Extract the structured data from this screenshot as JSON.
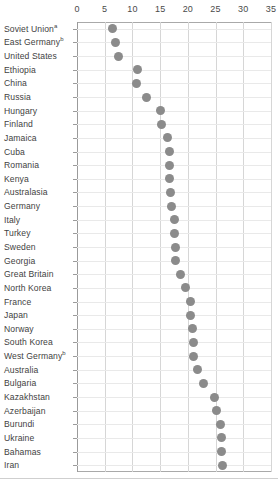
{
  "chart_data": {
    "type": "scatter",
    "title": "",
    "subtitle": "",
    "xlabel": "",
    "ylabel": "",
    "xlim": [
      0,
      35
    ],
    "ylim": null,
    "grid": true,
    "legend": null,
    "orientation": "horizontal",
    "xticks": [
      0,
      5,
      10,
      15,
      20,
      25,
      30,
      35
    ],
    "xtick_labels": [
      "0",
      "5",
      "10",
      "15",
      "20",
      "25",
      "30",
      "35"
    ],
    "marker": {
      "shape": "circle",
      "color": "#8b8b8b",
      "size": 9
    },
    "categories": [
      "Soviet Union",
      "East Germany",
      "United States",
      "Ethiopia",
      "China",
      "Russia",
      "Hungary",
      "Finland",
      "Jamaica",
      "Cuba",
      "Romania",
      "Kenya",
      "Australasia",
      "Germany",
      "Italy",
      "Turkey",
      "Sweden",
      "Georgia",
      "Great Britain",
      "North Korea",
      "France",
      "Japan",
      "Norway",
      "South Korea",
      "West Germany",
      "Australia",
      "Bulgaria",
      "Kazakhstan",
      "Azerbaijan",
      "Burundi",
      "Ukraine",
      "Bahamas",
      "Iran"
    ],
    "category_footnotes": {
      "Soviet Union": "a",
      "East Germany": "b",
      "West Germany": "b"
    },
    "values": [
      6.4,
      7.0,
      7.4,
      11.0,
      10.7,
      12.5,
      15.0,
      15.2,
      16.4,
      16.6,
      16.7,
      16.7,
      16.8,
      17.0,
      17.5,
      17.5,
      17.8,
      17.8,
      18.7,
      19.6,
      20.4,
      20.4,
      20.8,
      21.0,
      21.0,
      21.7,
      22.8,
      24.8,
      25.2,
      25.8,
      26.0,
      26.0,
      26.2
    ]
  }
}
